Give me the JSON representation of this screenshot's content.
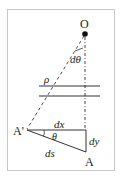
{
  "diagram": {
    "labels": {
      "origin": "O",
      "angle_small": "dθ",
      "rho": "ρ",
      "point_a_prime": "A'",
      "point_a": "A",
      "dx": "dx",
      "dy": "dy",
      "ds": "ds",
      "theta": "θ"
    },
    "colors": {
      "frame": "#c8c8c8",
      "line": "#333333",
      "dot": "#111111",
      "background": "#ffffff"
    }
  }
}
